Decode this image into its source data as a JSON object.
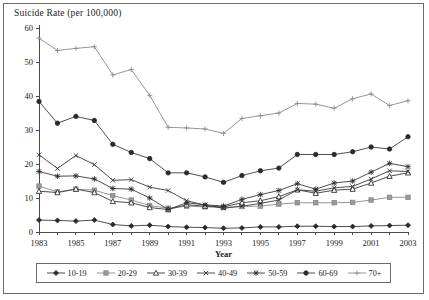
{
  "figure": {
    "title": "Suicide Rate (per 100,000)",
    "frame": true
  },
  "axes": {
    "xlabel": "Year",
    "ylabel": "Suicide Rate (per 100,000)",
    "y_ticks": [
      0,
      10,
      20,
      30,
      40,
      50,
      60
    ],
    "x_ticks_labeled": [
      1983,
      1985,
      1987,
      1989,
      1991,
      1993,
      1995,
      1997,
      1999,
      2001,
      2003
    ],
    "xlim": [
      1983,
      2003
    ],
    "ylim": [
      0,
      60
    ]
  },
  "legend": {
    "position": "bottom",
    "items": [
      {
        "label": "10-19",
        "marker": "diamond",
        "tone": "dark"
      },
      {
        "label": "20-29",
        "marker": "square",
        "tone": "light"
      },
      {
        "label": "30-39",
        "marker": "triangle",
        "tone": "dark"
      },
      {
        "label": "40-49",
        "marker": "cross",
        "tone": "dark"
      },
      {
        "label": "50-59",
        "marker": "star",
        "tone": "dark"
      },
      {
        "label": "60-69",
        "marker": "circle",
        "tone": "dark"
      },
      {
        "label": "70+",
        "marker": "plus",
        "tone": "light"
      }
    ]
  },
  "chart_data": {
    "type": "line",
    "title": "Suicide Rate (per 100,000)",
    "xlabel": "Year",
    "ylabel": "Suicide Rate (per 100,000)",
    "xlim": [
      1983,
      2003
    ],
    "ylim": [
      0,
      60
    ],
    "grid": false,
    "legend_position": "bottom",
    "x": [
      1983,
      1984,
      1985,
      1986,
      1987,
      1988,
      1989,
      1990,
      1991,
      1992,
      1993,
      1994,
      1995,
      1996,
      1997,
      1998,
      1999,
      2000,
      2001,
      2002,
      2003
    ],
    "series": [
      {
        "name": "10-19",
        "marker": "diamond",
        "tone": "dark",
        "values": [
          3.5,
          3.4,
          3.2,
          3.5,
          2.2,
          1.8,
          2.0,
          1.6,
          1.4,
          1.3,
          1.1,
          1.2,
          1.5,
          1.5,
          1.7,
          1.7,
          1.6,
          1.6,
          1.8,
          1.9,
          2.0
        ]
      },
      {
        "name": "20-29",
        "marker": "square",
        "tone": "light",
        "values": [
          13.5,
          11.8,
          12.6,
          12.3,
          10.7,
          9.4,
          7.8,
          7.0,
          7.6,
          7.4,
          7.2,
          7.5,
          7.6,
          8.2,
          8.6,
          8.6,
          8.6,
          8.7,
          9.4,
          10.2,
          10.2
        ]
      },
      {
        "name": "30-39",
        "marker": "triangle",
        "tone": "dark",
        "values": [
          12.0,
          11.6,
          12.6,
          11.6,
          9.0,
          8.6,
          7.2,
          6.6,
          8.0,
          7.6,
          7.4,
          8.6,
          9.2,
          10.4,
          12.4,
          11.4,
          12.3,
          12.6,
          14.4,
          16.4,
          17.4
        ]
      },
      {
        "name": "40-49",
        "marker": "cross",
        "tone": "dark",
        "values": [
          22.7,
          18.7,
          22.5,
          19.8,
          15.2,
          15.4,
          13.2,
          12.2,
          9.2,
          7.9,
          7.0,
          7.6,
          8.4,
          9.4,
          12.4,
          12.0,
          13.0,
          13.4,
          15.6,
          18.0,
          17.8
        ]
      },
      {
        "name": "50-59",
        "marker": "star",
        "tone": "dark",
        "values": [
          17.8,
          16.4,
          16.5,
          15.6,
          12.8,
          12.6,
          10.0,
          6.6,
          8.6,
          8.0,
          7.6,
          9.6,
          11.0,
          12.2,
          14.2,
          12.6,
          14.4,
          15.0,
          17.6,
          20.2,
          19.2
        ]
      },
      {
        "name": "60-69",
        "marker": "circle",
        "tone": "dark",
        "values": [
          38.4,
          32.0,
          34.0,
          32.8,
          25.8,
          23.4,
          21.6,
          17.4,
          17.4,
          16.2,
          14.6,
          16.6,
          18.0,
          18.8,
          22.8,
          22.8,
          22.8,
          23.6,
          25.0,
          24.4,
          28.0
        ]
      },
      {
        "name": "70+",
        "marker": "plus",
        "tone": "light",
        "values": [
          57.0,
          53.4,
          54.0,
          54.5,
          46.2,
          47.8,
          40.2,
          30.8,
          30.6,
          30.3,
          29.0,
          33.4,
          34.2,
          35.0,
          37.8,
          37.6,
          36.4,
          39.2,
          40.6,
          37.2,
          38.6
        ]
      }
    ]
  }
}
